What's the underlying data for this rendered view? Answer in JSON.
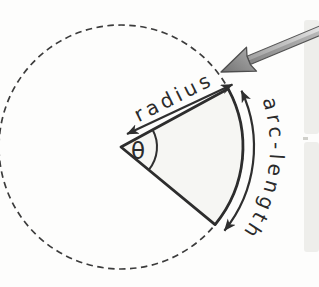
{
  "diagram": {
    "name": "circle-sector-diagram",
    "labels": {
      "theta": "θ",
      "radius": "radius",
      "arc_length": "arc-length"
    },
    "colors": {
      "line": "#2f2f2f",
      "sector_fill": "#f6f6f3",
      "dashed_circle": "#3c3c3c",
      "callout_arrow_light": "#dedede",
      "callout_arrow_dark": "#8a8a8a",
      "page_edge": "#ecece9",
      "background": "#fdfdfc"
    }
  }
}
